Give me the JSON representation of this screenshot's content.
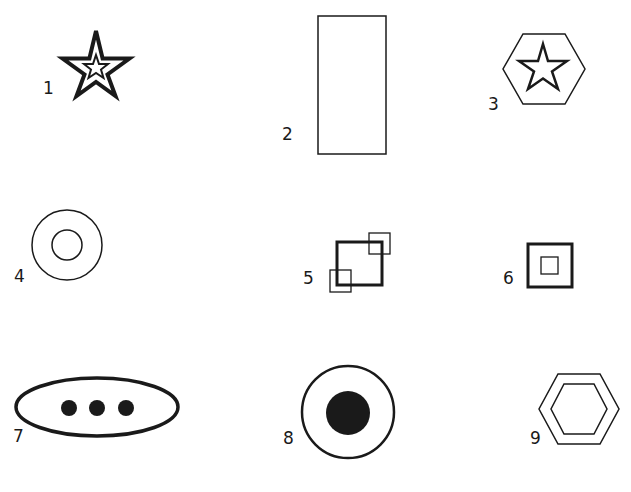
{
  "figure": {
    "background": "#ffffff",
    "ink": "#1a1a1a",
    "items": [
      {
        "number": "1",
        "shape": "star-in-star",
        "description": "Thick-outlined five-point star containing a smaller outlined star"
      },
      {
        "number": "2",
        "shape": "tall-rectangle",
        "description": "Tall thin-outlined rectangle"
      },
      {
        "number": "3",
        "shape": "star-in-hexagon",
        "description": "Hexagon outline containing a five-point star outline"
      },
      {
        "number": "4",
        "shape": "concentric-circles",
        "description": "Large circle outline containing a smaller circle outline"
      },
      {
        "number": "5",
        "shape": "square-with-corner-squares",
        "description": "Thick square with two small thin squares overlapping opposite corners"
      },
      {
        "number": "6",
        "shape": "square-in-square",
        "description": "Thick square outline containing a small thin square"
      },
      {
        "number": "7",
        "shape": "ellipse-with-three-dots",
        "description": "Wide thick ellipse containing three filled dots"
      },
      {
        "number": "8",
        "shape": "circle-with-filled-center",
        "description": "Circle outline containing a large filled circle"
      },
      {
        "number": "9",
        "shape": "hexagon-in-hexagon",
        "description": "Hexagon outline containing a smaller hexagon outline"
      }
    ]
  }
}
